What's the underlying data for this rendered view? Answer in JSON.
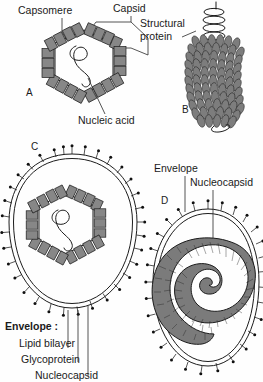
{
  "figure": {
    "background_color": "#fefefe",
    "capsomere_color": "#878787",
    "outline_color": "#1c1c1c",
    "spike_color": "#101010"
  },
  "labels": {
    "capsomere": "Capsomere",
    "capsid": "Capsid",
    "nucleic_acid": "Nucleic acid",
    "structural_protein_line1": "Structural",
    "structural_protein_line2": "protein",
    "envelope_heading": "Envelope :",
    "lipid_bilayer": "Lipid bilayer",
    "glycoprotein": "Glycoprotein",
    "nucleocapsid": "Nucleocapsid",
    "envelope_d": "Envelope",
    "nucleocapsid_d": "Nucleocapsid"
  },
  "panels": [
    {
      "letter": "A",
      "type": "naked-icosahedral",
      "description": "Hexagonal capsid of capsomeres enclosing nucleic acid",
      "parts": [
        "Capsomere",
        "Capsid",
        "Nucleic acid"
      ]
    },
    {
      "letter": "B",
      "type": "naked-helical",
      "description": "Rod-shaped helical virus with structural protein subunits and protruding nucleic acid helix",
      "parts": [
        "Structural protein"
      ]
    },
    {
      "letter": "C",
      "type": "enveloped-icosahedral",
      "description": "Enveloped virus with glycoprotein spikes surrounding an icosahedral nucleocapsid",
      "parts": [
        "Envelope :",
        "Lipid bilayer",
        "Glycoprotein",
        "Nucleocapsid"
      ]
    },
    {
      "letter": "D",
      "type": "enveloped-helical",
      "description": "Enveloped virus with coiled helical nucleocapsid",
      "parts": [
        "Envelope",
        "Nucleocapsid"
      ]
    }
  ]
}
